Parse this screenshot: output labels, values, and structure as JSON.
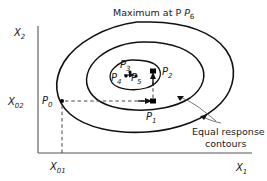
{
  "figure": {
    "title": "Maximum at P",
    "title_subscript": "6",
    "axes": {
      "x_label": "X",
      "x_label_subscript": "1",
      "y_label": "X",
      "y_label_subscript": "2",
      "x_tick_label": "X",
      "x_tick_subscript": "01",
      "y_tick_label": "X",
      "y_tick_subscript": "02"
    },
    "annotation": {
      "line1": "Equal  response",
      "line2": "contours"
    },
    "points": [
      {
        "name": "P",
        "subscript": "0",
        "label_x": 44,
        "label_y": 101,
        "dot_x": 62,
        "dot_y": 101
      },
      {
        "name": "P",
        "subscript": "1",
        "label_x": 148,
        "label_y": 118,
        "dot_x": 153,
        "dot_y": 101
      },
      {
        "name": "P",
        "subscript": "2",
        "label_x": 163,
        "label_y": 74,
        "dot_x": 153,
        "dot_y": 71
      },
      {
        "name": "P",
        "subscript": "3",
        "label_x": 122,
        "label_y": 66,
        "dot_x": 130,
        "dot_y": 72
      },
      {
        "name": "P",
        "subscript": "4",
        "label_x": 113,
        "label_y": 79,
        "dot_x": 126,
        "dot_y": 76
      },
      {
        "name": "P",
        "subscript": "5",
        "label_x": 131,
        "label_y": 79,
        "dot_x": 134,
        "dot_y": 76
      }
    ],
    "colors": {
      "contour_stroke": "#111111",
      "axis_stroke": "#555555",
      "dash_stroke": "#444444",
      "text": "#1a1a1a",
      "background": "#ffffff"
    }
  }
}
